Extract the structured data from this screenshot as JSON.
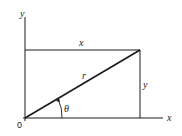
{
  "diagram": {
    "labels": {
      "y_axis": "y",
      "x_axis": "x",
      "origin": "0",
      "top_side": "x",
      "right_side": "y",
      "hypotenuse": "r",
      "angle": "θ"
    },
    "colors": {
      "line": "#1a1a1a",
      "background": "#ffffff"
    }
  }
}
